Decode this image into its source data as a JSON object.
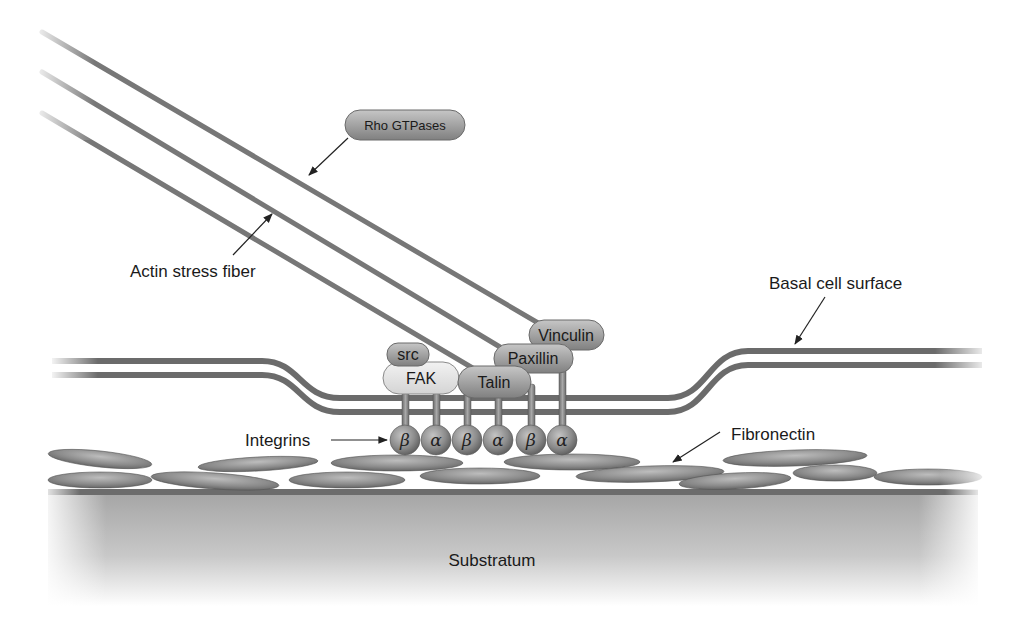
{
  "diagram": {
    "labels": {
      "rho": "Rho GTPases",
      "actin": "Actin stress fiber",
      "basal": "Basal cell surface",
      "integrins": "Integrins",
      "fibronectin": "Fibronectin",
      "substratum": "Substratum"
    },
    "proteins": {
      "src": "src",
      "fak": "FAK",
      "talin": "Talin",
      "paxillin": "Paxillin",
      "vinculin": "Vinculin"
    },
    "integrin_subunits": [
      "β",
      "α",
      "β",
      "α",
      "β",
      "α"
    ],
    "colors": {
      "protein_dark": "#9a9a9a",
      "protein_light": "#e2e2e2",
      "membrane": "#6b6b6b",
      "fiber": "#777777",
      "substratum_top": "#a8a8a8",
      "substratum_bottom": "#ffffff"
    }
  }
}
